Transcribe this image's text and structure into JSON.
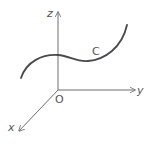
{
  "diagram": {
    "type": "3d-coordinate-axes-with-space-curve",
    "origin": {
      "label": "O",
      "x": 58,
      "y": 90
    },
    "axes": [
      {
        "name": "z",
        "label": "z",
        "direction": "up",
        "start": [
          58,
          90
        ],
        "end": [
          58,
          12
        ],
        "label_pos": [
          47,
          17
        ]
      },
      {
        "name": "y",
        "label": "y",
        "direction": "right",
        "start": [
          58,
          90
        ],
        "end": [
          135,
          90
        ],
        "label_pos": [
          137,
          94
        ]
      },
      {
        "name": "x",
        "label": "x",
        "direction": "down-left",
        "start": [
          58,
          90
        ],
        "end": [
          19,
          131
        ],
        "label_pos": [
          8,
          131
        ]
      }
    ],
    "curve": {
      "label": "C",
      "label_pos": [
        92,
        55
      ],
      "path": "M21,78 C26,62 42,54 58,55 C70,56 76,62 88,61 C104,60 122,48 127,25"
    },
    "colors": {
      "axis": "#6e6e6e",
      "curve": "#4a4a4a",
      "text": "#555555",
      "background": "#ffffff"
    }
  }
}
